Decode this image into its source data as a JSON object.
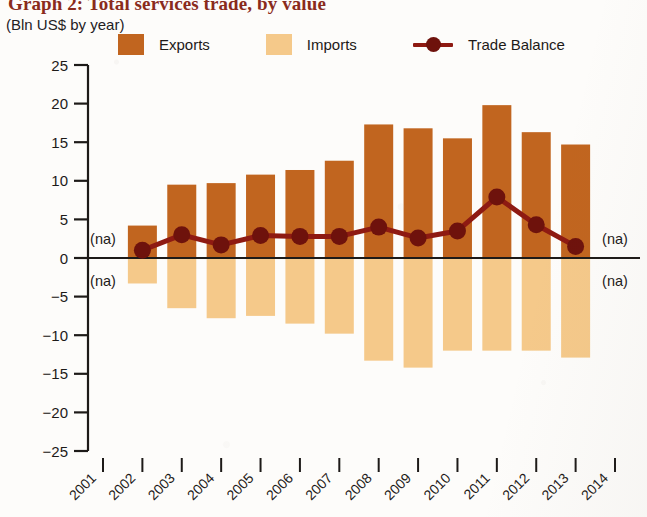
{
  "header": {
    "title": "Graph 2: Total services trade, by value",
    "subtitle": "(Bln US$ by year)"
  },
  "legend": {
    "position": "top",
    "items": [
      {
        "label": "Exports",
        "swatch": "legend-swatch-exports",
        "color": "#C1651F",
        "type": "bar"
      },
      {
        "label": "Imports",
        "swatch": "legend-swatch-imports",
        "color": "#F5C98A",
        "type": "bar"
      },
      {
        "label": "Trade Balance",
        "swatch": "legend-line-balance",
        "color": "#8E1A12",
        "type": "line"
      }
    ]
  },
  "annotations": {
    "na_label": "(na)",
    "na_positions": [
      {
        "year": "2001",
        "side": "left",
        "band": "above-zero"
      },
      {
        "year": "2001",
        "side": "left",
        "band": "below-zero"
      },
      {
        "year": "2014",
        "side": "right",
        "band": "above-zero"
      },
      {
        "year": "2014",
        "side": "right",
        "band": "below-zero"
      }
    ]
  },
  "colors": {
    "exports": "#C1651F",
    "imports": "#F5C98A",
    "balance": "#8E1A12",
    "balance_marker": "#6E120C",
    "axis": "#1d1a18",
    "title": "#8a2b1c",
    "background": "#fdfcfa"
  },
  "chart_data": {
    "type": "bar",
    "title": "Graph 2: Total services trade, by value",
    "subtitle": "(Bln US$ by year)",
    "xlabel": "",
    "ylabel": "Bln US$ by year",
    "ylim": [
      -25,
      25
    ],
    "ytick_step": 5,
    "yticks": [
      25,
      20,
      15,
      10,
      5,
      0,
      -5,
      -10,
      -15,
      -20,
      -25
    ],
    "ytick_labels": [
      "25",
      "20",
      "15",
      "10",
      "5",
      "0",
      "-5",
      "-10",
      "-15",
      "-20",
      "-25"
    ],
    "grid": false,
    "zero_line": true,
    "legend_position": "top",
    "x": [
      "2001",
      "2002",
      "2003",
      "2004",
      "2005",
      "2006",
      "2007",
      "2008",
      "2009",
      "2010",
      "2011",
      "2012",
      "2013",
      "2014"
    ],
    "categories": [
      "2001",
      "2002",
      "2003",
      "2004",
      "2005",
      "2006",
      "2007",
      "2008",
      "2009",
      "2010",
      "2011",
      "2012",
      "2013",
      "2014"
    ],
    "series": [
      {
        "name": "Exports",
        "type": "bar",
        "color": "#C1651F",
        "values": [
          null,
          4.2,
          9.5,
          9.7,
          10.8,
          11.4,
          12.6,
          17.3,
          16.8,
          15.5,
          19.8,
          16.3,
          14.7,
          null
        ]
      },
      {
        "name": "Imports",
        "type": "bar",
        "color": "#F5C98A",
        "values": [
          null,
          -3.3,
          -6.5,
          -7.8,
          -7.5,
          -8.5,
          -9.8,
          -13.3,
          -14.2,
          -12.0,
          -12.0,
          -12.0,
          -12.9,
          null
        ]
      },
      {
        "name": "Trade Balance",
        "type": "line",
        "color": "#8E1A12",
        "values": [
          null,
          1.0,
          3.0,
          1.7,
          2.9,
          2.8,
          2.8,
          4.0,
          2.6,
          3.5,
          7.9,
          4.3,
          1.5,
          null
        ]
      }
    ]
  }
}
